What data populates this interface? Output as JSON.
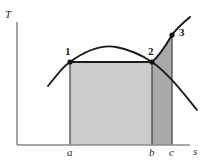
{
  "figure": {
    "kind": "temperature-entropy-diagram",
    "background": "#ffffff"
  },
  "axes": {
    "y_label": "T",
    "x_label": "s",
    "axis_color": "#8a8a8a",
    "origin": {
      "x": 17,
      "y": 145
    },
    "x_end": {
      "x": 190,
      "y": 145
    },
    "y_top": {
      "x": 17,
      "y": 22
    },
    "tick_labels": [
      {
        "name": "a",
        "text": "a",
        "x": 70
      },
      {
        "name": "b",
        "text": "b",
        "x": 152
      },
      {
        "name": "c",
        "text": "c",
        "x": 172
      }
    ]
  },
  "states": [
    {
      "name": "state-1",
      "label": "1",
      "x": 70,
      "y": 62
    },
    {
      "name": "state-2",
      "label": "2",
      "x": 152,
      "y": 62
    },
    {
      "name": "state-3",
      "label": "3",
      "x": 172,
      "y": 35
    }
  ],
  "curves": {
    "saturation_dome": {
      "name": "saturation-dome-curve",
      "color": "#1a1a1a",
      "width": 1.8,
      "path": "M 48,86 C 60,71 64,66 70,62 C 88,49 104,45 116,47 C 132,50 143,56 152,62 C 168,73 184,94 197,110",
      "apex": {
        "x": 110,
        "y": 46
      }
    },
    "superheat_line": {
      "name": "superheat-process-curve",
      "color": "#1a1a1a",
      "width": 2.0,
      "path": "M 152,62 C 159,56 165,47 172,35 C 177,28 184,22 190,17"
    },
    "isobar_1_2": {
      "name": "constant-pressure-line-1-2",
      "color": "#1a1a1a",
      "width": 2.0,
      "path": "M 70,62 L 152,62"
    }
  },
  "regions": [
    {
      "name": "area-under-1-2",
      "fill": "#cbcbcb",
      "path": "M 70,62 L 152,62 L 152,145 L 70,145 Z"
    },
    {
      "name": "area-under-2-3",
      "fill": "#a9a9a9",
      "path": "M 152,62 C 159,56 165,47 172,35 L 172,145 L 152,145 Z"
    }
  ],
  "boundary_lines": [
    {
      "name": "vertical-line-a",
      "x": 70,
      "y1": 62,
      "y2": 145,
      "color": "#4a4a4a"
    },
    {
      "name": "vertical-line-b",
      "x": 152,
      "y1": 62,
      "y2": 145,
      "color": "#4a4a4a"
    },
    {
      "name": "vertical-line-c",
      "x": 172,
      "y1": 35,
      "y2": 145,
      "color": "#4a4a4a"
    }
  ],
  "chart_data": {
    "type": "line",
    "title": "",
    "xlabel": "s",
    "ylabel": "T",
    "grid": false,
    "legend": null,
    "annotations": [
      "1",
      "2",
      "3",
      "a",
      "b",
      "c"
    ],
    "series": [
      {
        "name": "saturation dome",
        "points": [
          {
            "x": 48,
            "y": 86
          },
          {
            "x": 70,
            "y": 62
          },
          {
            "x": 110,
            "y": 46
          },
          {
            "x": 152,
            "y": 62
          },
          {
            "x": 197,
            "y": 110
          }
        ]
      },
      {
        "name": "process 2-3 superheat",
        "points": [
          {
            "x": 152,
            "y": 62
          },
          {
            "x": 172,
            "y": 35
          },
          {
            "x": 190,
            "y": 17
          }
        ]
      },
      {
        "name": "process 1-2 isobar",
        "points": [
          {
            "x": 70,
            "y": 62
          },
          {
            "x": 152,
            "y": 62
          }
        ]
      }
    ],
    "marked_points": [
      {
        "label": "1",
        "x": 70,
        "y": 62
      },
      {
        "label": "2",
        "x": 152,
        "y": 62
      },
      {
        "label": "3",
        "x": 172,
        "y": 35
      }
    ],
    "x_ticks": [
      {
        "label": "a",
        "x": 70
      },
      {
        "label": "b",
        "x": 152
      },
      {
        "label": "c",
        "x": 172
      }
    ],
    "shaded_areas": [
      {
        "name": "area a-1-2-b",
        "shade": "light-gray"
      },
      {
        "name": "area b-2-3-c",
        "shade": "dark-gray"
      }
    ]
  }
}
